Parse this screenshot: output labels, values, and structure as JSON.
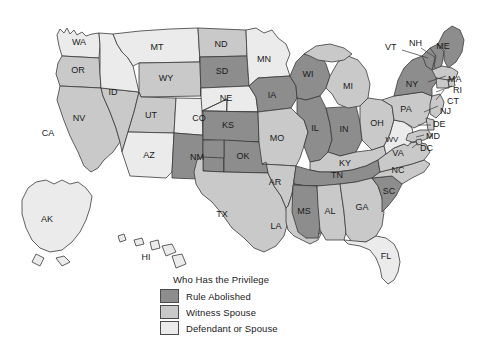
{
  "map": {
    "title": "Who Has the Privilege",
    "colors": {
      "rule_abolished": "#8d8d8d",
      "witness_spouse": "#c9c9c9",
      "defendant_or_spouse": "#ebebeb",
      "border": "#3a3a3a",
      "background": "#ffffff"
    },
    "legend": [
      {
        "label": "Rule Abolished",
        "color": "#8d8d8d"
      },
      {
        "label": "Witness Spouse",
        "color": "#c9c9c9"
      },
      {
        "label": "Defendant or Spouse",
        "color": "#ebebeb"
      }
    ],
    "states": [
      {
        "code": "WA",
        "category": "defendant_or_spouse"
      },
      {
        "code": "OR",
        "category": "witness_spouse"
      },
      {
        "code": "CA",
        "category": "witness_spouse"
      },
      {
        "code": "NV",
        "category": "witness_spouse"
      },
      {
        "code": "ID",
        "category": "defendant_or_spouse"
      },
      {
        "code": "MT",
        "category": "defendant_or_spouse"
      },
      {
        "code": "WY",
        "category": "witness_spouse"
      },
      {
        "code": "UT",
        "category": "witness_spouse"
      },
      {
        "code": "AZ",
        "category": "defendant_or_spouse"
      },
      {
        "code": "CO",
        "category": "defendant_or_spouse"
      },
      {
        "code": "NM",
        "category": "rule_abolished"
      },
      {
        "code": "ND",
        "category": "witness_spouse"
      },
      {
        "code": "SD",
        "category": "rule_abolished"
      },
      {
        "code": "NE",
        "category": "defendant_or_spouse"
      },
      {
        "code": "KS",
        "category": "rule_abolished"
      },
      {
        "code": "OK",
        "category": "rule_abolished"
      },
      {
        "code": "TX",
        "category": "witness_spouse"
      },
      {
        "code": "MN",
        "category": "defendant_or_spouse"
      },
      {
        "code": "IA",
        "category": "rule_abolished"
      },
      {
        "code": "MO",
        "category": "witness_spouse"
      },
      {
        "code": "AR",
        "category": "witness_spouse"
      },
      {
        "code": "LA",
        "category": "witness_spouse"
      },
      {
        "code": "WI",
        "category": "rule_abolished"
      },
      {
        "code": "IL",
        "category": "rule_abolished"
      },
      {
        "code": "IN",
        "category": "rule_abolished"
      },
      {
        "code": "MI",
        "category": "witness_spouse"
      },
      {
        "code": "OH",
        "category": "witness_spouse"
      },
      {
        "code": "KY",
        "category": "witness_spouse"
      },
      {
        "code": "TN",
        "category": "rule_abolished"
      },
      {
        "code": "MS",
        "category": "rule_abolished"
      },
      {
        "code": "AL",
        "category": "witness_spouse"
      },
      {
        "code": "GA",
        "category": "witness_spouse"
      },
      {
        "code": "FL",
        "category": "defendant_or_spouse"
      },
      {
        "code": "SC",
        "category": "rule_abolished"
      },
      {
        "code": "NC",
        "category": "witness_spouse"
      },
      {
        "code": "VA",
        "category": "witness_spouse"
      },
      {
        "code": "WV",
        "category": "defendant_or_spouse"
      },
      {
        "code": "MD",
        "category": "witness_spouse"
      },
      {
        "code": "DE",
        "category": "witness_spouse"
      },
      {
        "code": "DC",
        "category": "witness_spouse"
      },
      {
        "code": "PA",
        "category": "witness_spouse"
      },
      {
        "code": "NJ",
        "category": "witness_spouse"
      },
      {
        "code": "NY",
        "category": "rule_abolished"
      },
      {
        "code": "CT",
        "category": "witness_spouse"
      },
      {
        "code": "RI",
        "category": "witness_spouse"
      },
      {
        "code": "MA",
        "category": "witness_spouse"
      },
      {
        "code": "VT",
        "category": "rule_abolished"
      },
      {
        "code": "NH",
        "category": "rule_abolished"
      },
      {
        "code": "ME",
        "category": "rule_abolished"
      },
      {
        "code": "AK",
        "category": "defendant_or_spouse"
      },
      {
        "code": "HI",
        "category": "defendant_or_spouse"
      }
    ]
  }
}
